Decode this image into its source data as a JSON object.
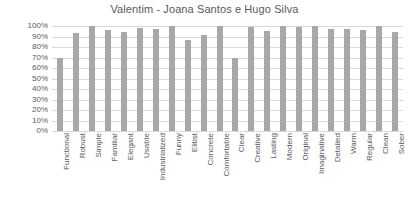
{
  "chart_data": {
    "type": "bar",
    "title": "Valentim - Joana Santos e Hugo Silva",
    "xlabel": "",
    "ylabel": "",
    "ylim": [
      0,
      100
    ],
    "ytick_labels": [
      "100%",
      "90%",
      "80%",
      "70%",
      "60%",
      "50%",
      "40%",
      "30%",
      "20%",
      "10%",
      "0%"
    ],
    "ytick_values": [
      100,
      90,
      80,
      70,
      60,
      50,
      40,
      30,
      20,
      10,
      0
    ],
    "grid": true,
    "legend": "none",
    "bar_color": "#9c9c9c",
    "gridline_color": "#d9d9d9",
    "text_color": "#595959",
    "categories": [
      "Functional",
      "Robust",
      "Simple",
      "Familiar",
      "Elegant",
      "Usable",
      "Industrialized",
      "Funny",
      "Elitist",
      "Concrete",
      "Comfortable",
      "Clear",
      "Creative",
      "Lasting",
      "Modern",
      "Original",
      "Imaginative",
      "Detailed",
      "Warm",
      "Regular",
      "Clean",
      "Sober"
    ],
    "values": [
      70,
      93,
      100,
      96,
      94,
      98,
      97,
      100,
      87,
      91,
      100,
      70,
      99,
      95,
      100,
      99,
      100,
      97,
      97,
      96,
      100,
      94
    ]
  }
}
